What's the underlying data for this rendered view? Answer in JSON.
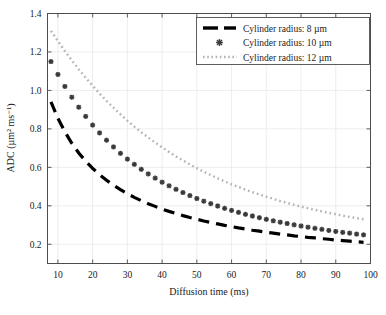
{
  "chart_data": {
    "type": "line",
    "title": "",
    "xlabel": "Diffusion time (ms)",
    "ylabel": "ADC (µm² ms⁻¹)",
    "xlim": [
      7,
      100
    ],
    "ylim": [
      0.1,
      1.4
    ],
    "xticks": [
      10,
      20,
      30,
      40,
      50,
      60,
      70,
      80,
      90,
      100
    ],
    "yticks": [
      0.2,
      0.4,
      0.6,
      0.8,
      1.0,
      1.2,
      1.4
    ],
    "xtick_labels": [
      "10",
      "20",
      "30",
      "40",
      "50",
      "60",
      "70",
      "80",
      "90",
      "100"
    ],
    "ytick_labels": [
      "0.2",
      "0.4",
      "0.6",
      "0.8",
      "1.0",
      "1.2",
      "1.4"
    ],
    "grid": true,
    "legend_position": "top-right",
    "series": [
      {
        "name": "Cylinder radius: 8 µm",
        "style": "dashed",
        "color": "#000000",
        "linewidth": 3.2,
        "x": [
          8,
          10,
          12,
          14,
          16,
          18,
          20,
          22,
          24,
          26,
          28,
          30,
          32,
          34,
          36,
          38,
          40,
          42,
          44,
          46,
          48,
          50,
          52,
          54,
          56,
          58,
          60,
          62,
          64,
          66,
          68,
          70,
          72,
          74,
          76,
          78,
          80,
          82,
          84,
          86,
          88,
          90,
          92,
          94,
          96,
          98
        ],
        "y": [
          0.94,
          0.855,
          0.785,
          0.725,
          0.675,
          0.632,
          0.595,
          0.562,
          0.533,
          0.507,
          0.484,
          0.463,
          0.444,
          0.427,
          0.411,
          0.397,
          0.383,
          0.371,
          0.36,
          0.349,
          0.339,
          0.33,
          0.321,
          0.313,
          0.306,
          0.298,
          0.292,
          0.285,
          0.279,
          0.273,
          0.268,
          0.263,
          0.258,
          0.253,
          0.249,
          0.244,
          0.24,
          0.236,
          0.233,
          0.229,
          0.226,
          0.222,
          0.219,
          0.216,
          0.213,
          0.21
        ]
      },
      {
        "name": "Cylinder radius: 10 µm",
        "style": "markers",
        "marker": "asterisk",
        "color": "#3a3a3a",
        "markersize": 5.0,
        "x": [
          8,
          10,
          12,
          14,
          16,
          18,
          20,
          22,
          24,
          26,
          28,
          30,
          32,
          34,
          36,
          38,
          40,
          42,
          44,
          46,
          48,
          50,
          52,
          54,
          56,
          58,
          60,
          62,
          64,
          66,
          68,
          70,
          72,
          74,
          76,
          78,
          80,
          82,
          84,
          86,
          88,
          90,
          92,
          94,
          96,
          98
        ],
        "y": [
          1.15,
          1.083,
          1.021,
          0.965,
          0.913,
          0.865,
          0.82,
          0.779,
          0.741,
          0.706,
          0.673,
          0.643,
          0.616,
          0.59,
          0.566,
          0.544,
          0.523,
          0.504,
          0.486,
          0.469,
          0.453,
          0.438,
          0.424,
          0.411,
          0.399,
          0.387,
          0.376,
          0.366,
          0.356,
          0.347,
          0.338,
          0.33,
          0.322,
          0.315,
          0.308,
          0.301,
          0.295,
          0.289,
          0.283,
          0.278,
          0.272,
          0.267,
          0.262,
          0.258,
          0.253,
          0.249
        ]
      },
      {
        "name": "Cylinder radius: 12 µm",
        "style": "dotted",
        "color": "#b3b3b3",
        "linewidth": 2.4,
        "x": [
          8,
          10,
          12,
          14,
          16,
          18,
          20,
          22,
          24,
          26,
          28,
          30,
          32,
          34,
          36,
          38,
          40,
          42,
          44,
          46,
          48,
          50,
          52,
          54,
          56,
          58,
          60,
          62,
          64,
          66,
          68,
          70,
          72,
          74,
          76,
          78,
          80,
          82,
          84,
          86,
          88,
          90,
          92,
          94,
          96,
          98
        ],
        "y": [
          1.31,
          1.257,
          1.205,
          1.156,
          1.11,
          1.066,
          1.024,
          0.984,
          0.946,
          0.91,
          0.876,
          0.843,
          0.812,
          0.783,
          0.755,
          0.729,
          0.704,
          0.68,
          0.657,
          0.636,
          0.615,
          0.596,
          0.577,
          0.56,
          0.543,
          0.527,
          0.512,
          0.498,
          0.484,
          0.471,
          0.459,
          0.447,
          0.436,
          0.425,
          0.415,
          0.405,
          0.396,
          0.387,
          0.379,
          0.371,
          0.363,
          0.356,
          0.349,
          0.342,
          0.336,
          0.33
        ]
      }
    ]
  },
  "legend": {
    "items": [
      {
        "label": "Cylinder radius: 8 µm",
        "swatch": "dashed-swatch"
      },
      {
        "label": "Cylinder radius: 10 µm",
        "swatch": "asterisk-swatch"
      },
      {
        "label": "Cylinder radius: 12 µm",
        "swatch": "dotted-swatch"
      }
    ]
  },
  "colors": {
    "series1": "#000000",
    "series2": "#3a3a3a",
    "series3": "#b3b3b3",
    "axis": "#4d4d4d",
    "grid": "#e8e8e8",
    "text": "#1a1a1a",
    "background": "#ffffff"
  }
}
